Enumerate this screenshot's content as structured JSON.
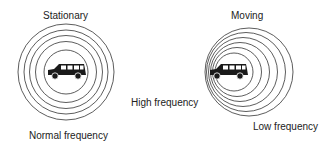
{
  "diagram": {
    "stationary": {
      "title": "Stationary",
      "caption": "Normal frequency"
    },
    "moving": {
      "title": "Moving",
      "front_caption": "High frequency",
      "rear_caption": "Low frequency"
    },
    "icons": {
      "vehicle": "car-icon",
      "waves": "sound-wave-circles"
    },
    "colors": {
      "line": "#333333",
      "car": "#1a1a1a",
      "background": "#ffffff"
    }
  }
}
